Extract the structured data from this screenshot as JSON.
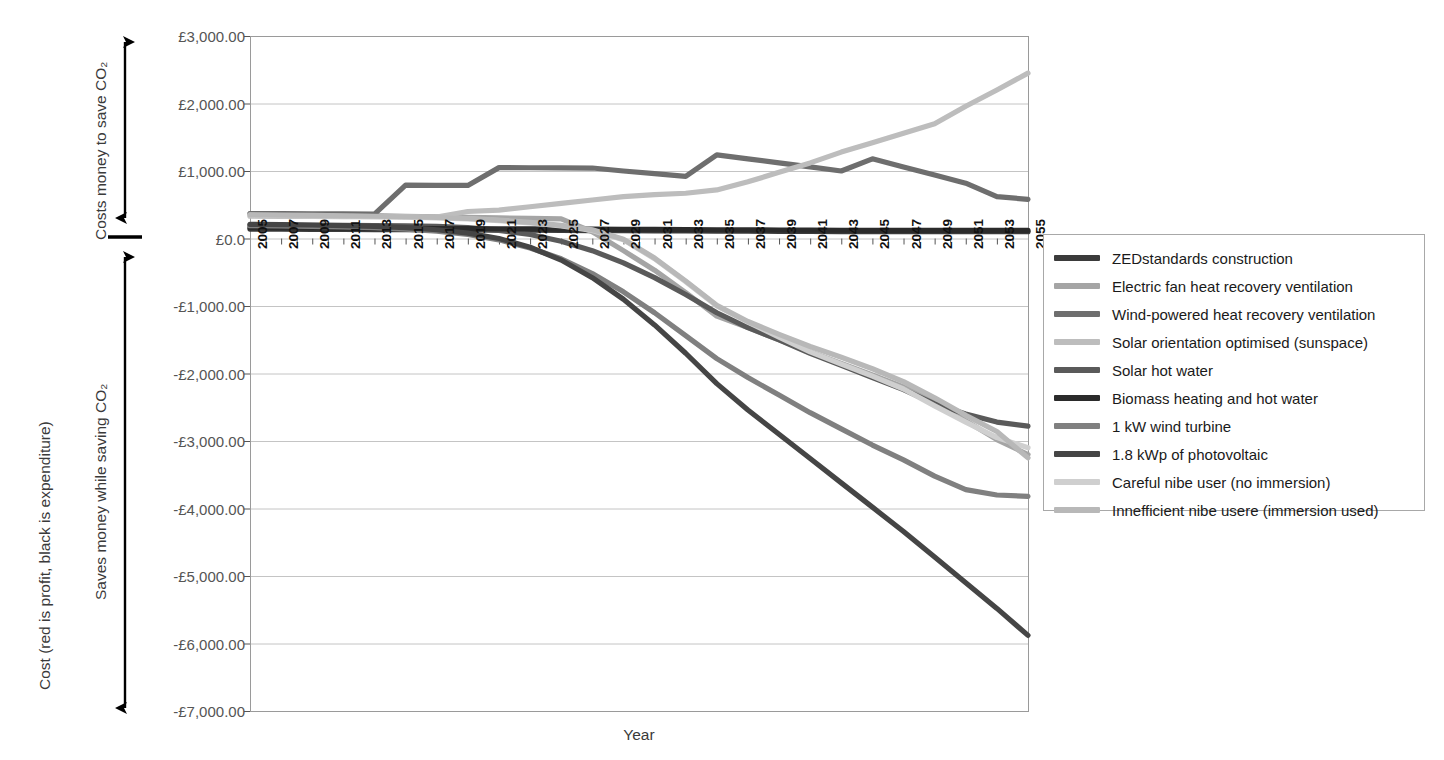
{
  "chart_data": {
    "type": "line",
    "title": "",
    "xlabel": "Year",
    "ylabel": "Cost (red is profit, black is expenditure)",
    "ylabel_upper": "Costs money to save CO₂",
    "ylabel_lower": "Saves money while saving CO₂",
    "xlim": [
      2005,
      2055
    ],
    "ylim": [
      -7000,
      3000
    ],
    "ytick_step": 1000,
    "grid": true,
    "legend_position": "right-outside",
    "ytick_labels": [
      "£3,000.00",
      "£2,000.00",
      "£1,000.00",
      "£0.0",
      "-£1,000.00",
      "-£2,000.00",
      "-£3,000.00",
      "-£4,000.00",
      "-£5,000.00",
      "-£6,000.00",
      "-£7,000.00"
    ],
    "ytick_values": [
      3000,
      2000,
      1000,
      0,
      -1000,
      -2000,
      -3000,
      -4000,
      -5000,
      -6000,
      -7000
    ],
    "xtick_labels": [
      "2005",
      "2007",
      "2009",
      "2011",
      "2013",
      "2015",
      "2017",
      "2019",
      "2021",
      "2023",
      "2025",
      "2027",
      "2029",
      "2031",
      "2033",
      "2035",
      "2037",
      "2039",
      "2041",
      "2043",
      "2045",
      "2047",
      "2049",
      "2051",
      "2053",
      "2055"
    ],
    "x": [
      2005,
      2007,
      2009,
      2011,
      2013,
      2015,
      2017,
      2019,
      2021,
      2023,
      2025,
      2027,
      2029,
      2031,
      2033,
      2035,
      2037,
      2039,
      2041,
      2043,
      2045,
      2047,
      2049,
      2051,
      2053,
      2055
    ],
    "series": [
      {
        "name": "ZEDstandards construction",
        "color": "#3b3b3b",
        "values": [
          140,
          138,
          136,
          134,
          132,
          130,
          128,
          126,
          124,
          122,
          120,
          118,
          116,
          114,
          112,
          110,
          108,
          106,
          104,
          102,
          100,
          100,
          100,
          100,
          100,
          100
        ]
      },
      {
        "name": "Electric fan heat recovery ventilation",
        "color": "#a5a5a5",
        "values": [
          370,
          362,
          354,
          346,
          338,
          330,
          322,
          314,
          306,
          298,
          290,
          100,
          -180,
          -470,
          -800,
          -1150,
          -1320,
          -1500,
          -1680,
          -1850,
          -2020,
          -2200,
          -2420,
          -2700,
          -2980,
          -3200
        ]
      },
      {
        "name": "Wind-powered heat recovery ventilation",
        "color": "#6e6e6e",
        "values": [
          370,
          368,
          366,
          364,
          362,
          790,
          788,
          786,
          1050,
          1048,
          1046,
          1044,
          1000,
          960,
          920,
          1240,
          1180,
          1120,
          1060,
          1000,
          1180,
          1060,
          940,
          820,
          620,
          580
        ]
      },
      {
        "name": "Solar orientation optimised (sunspace)",
        "color": "#bdbdbd",
        "values": [
          330,
          328,
          326,
          324,
          322,
          320,
          318,
          400,
          420,
          470,
          520,
          570,
          620,
          650,
          670,
          720,
          840,
          980,
          1120,
          1280,
          1420,
          1560,
          1700,
          1960,
          2200,
          2450
        ]
      },
      {
        "name": "Solar hot water",
        "color": "#5a5a5a",
        "values": [
          200,
          198,
          196,
          194,
          190,
          186,
          180,
          160,
          120,
          60,
          -40,
          -180,
          -360,
          -580,
          -830,
          -1100,
          -1320,
          -1500,
          -1700,
          -1880,
          -2060,
          -2240,
          -2450,
          -2600,
          -2720,
          -2780
        ]
      },
      {
        "name": "Biomass heating and hot water",
        "color": "#2b2b2b",
        "values": [
          160,
          158,
          156,
          154,
          152,
          150,
          148,
          146,
          144,
          142,
          140,
          138,
          136,
          134,
          132,
          130,
          128,
          126,
          124,
          122,
          120,
          120,
          120,
          120,
          120,
          120
        ]
      },
      {
        "name": "1 kW wind turbine",
        "color": "#808080",
        "values": [
          190,
          185,
          180,
          172,
          160,
          140,
          110,
          60,
          -20,
          -140,
          -300,
          -520,
          -790,
          -1100,
          -1440,
          -1780,
          -2060,
          -2320,
          -2580,
          -2820,
          -3060,
          -3280,
          -3520,
          -3720,
          -3800,
          -3820
        ]
      },
      {
        "name": "1.8 kWp of photovoltaic",
        "color": "#454545",
        "values": [
          210,
          205,
          200,
          192,
          180,
          160,
          130,
          80,
          0,
          -130,
          -320,
          -580,
          -900,
          -1280,
          -1700,
          -2150,
          -2540,
          -2900,
          -3260,
          -3620,
          -3980,
          -4340,
          -4720,
          -5100,
          -5480,
          -5880
        ]
      },
      {
        "name": "Careful nibe user (no immersion)",
        "color": "#cfcfcf",
        "values": [
          345,
          340,
          336,
          330,
          324,
          316,
          306,
          290,
          265,
          230,
          185,
          120,
          -20,
          -300,
          -640,
          -1000,
          -1240,
          -1460,
          -1680,
          -1860,
          -2040,
          -2230,
          -2480,
          -2720,
          -2950,
          -3100
        ]
      },
      {
        "name": "Innefficient nibe usere (immersion used)",
        "color": "#b8b8b8",
        "values": [
          350,
          346,
          342,
          336,
          330,
          322,
          312,
          296,
          272,
          238,
          195,
          130,
          -10,
          -290,
          -630,
          -990,
          -1230,
          -1420,
          -1600,
          -1760,
          -1930,
          -2120,
          -2360,
          -2620,
          -2860,
          -3250
        ]
      }
    ],
    "legend_entries": [
      "ZEDstandards construction",
      "Electric fan heat recovery ventilation",
      "Wind-powered heat recovery ventilation",
      "Solar orientation optimised (sunspace)",
      "Solar hot water",
      "Biomass heating and hot water",
      "1 kW wind turbine",
      "1.8 kWp of photovoltaic",
      "Careful nibe user (no immersion)",
      "Innefficient nibe usere (immersion used)"
    ]
  }
}
